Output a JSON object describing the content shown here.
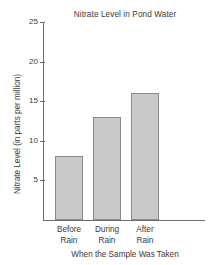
{
  "chart_data": {
    "type": "bar",
    "title": "Nitrate Level in Pond Water",
    "xlabel": "When the Sample Was Taken",
    "ylabel": "Nitrate Level (in parts per million)",
    "categories": [
      "Before Rain",
      "During Rain",
      "After Rain"
    ],
    "category_lines": [
      [
        "Before",
        "Rain"
      ],
      [
        "During",
        "Rain"
      ],
      [
        "After",
        "Rain"
      ]
    ],
    "values": [
      8,
      13,
      16
    ],
    "ylim": [
      0,
      25
    ],
    "yticks": [
      5,
      10,
      15,
      20,
      25
    ],
    "ytick_labels": [
      "5",
      "10",
      "15",
      "20",
      "25"
    ],
    "grid": false,
    "legend": false,
    "bar_color": "#c9c9c9",
    "bar_border_color": "#8a8a8a",
    "axis_color": "#6d6e71",
    "text_color": "#3a3a3a",
    "background": "#ffffff"
  }
}
